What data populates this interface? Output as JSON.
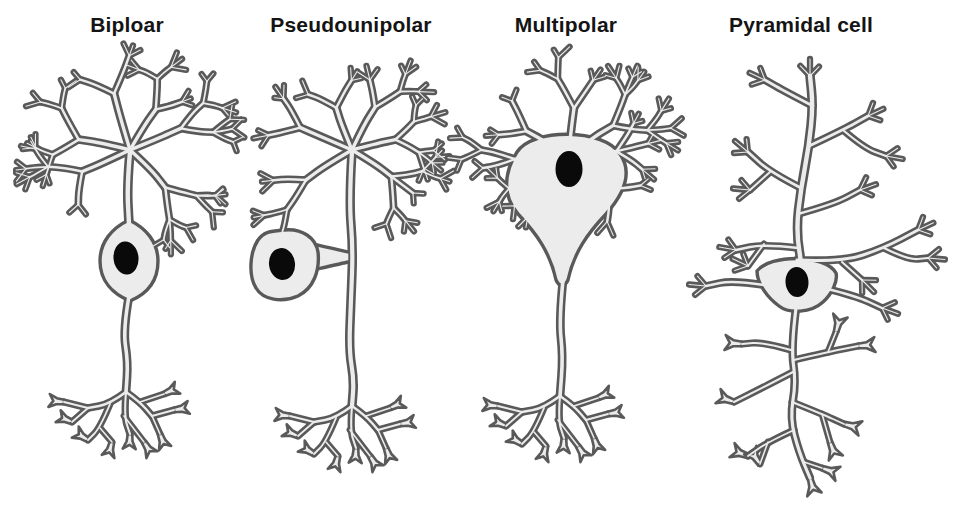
{
  "figure": {
    "kind": "neuron-morphology-comparison",
    "background": "#ffffff"
  },
  "colors": {
    "membrane_fill": "#ececec",
    "membrane_outline": "#595959",
    "nucleus": "#0a0a0a",
    "label": "#141414"
  },
  "panels": [
    {
      "id": "bipolar",
      "label": "Biploar"
    },
    {
      "id": "pseudounipolar",
      "label": "Pseudounipolar"
    },
    {
      "id": "multipolar",
      "label": "Multipolar"
    },
    {
      "id": "pyramidal",
      "label": "Pyramidal cell"
    }
  ]
}
